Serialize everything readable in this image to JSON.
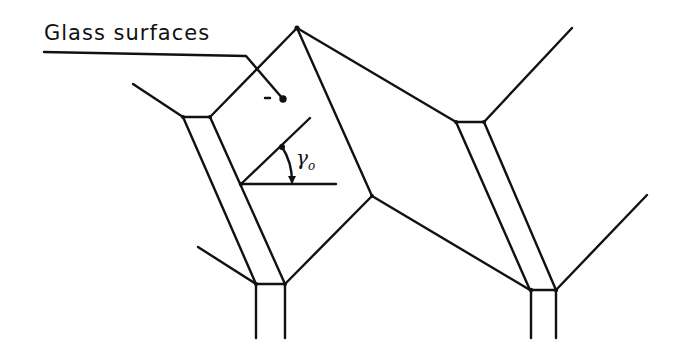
{
  "diagram": {
    "title_label": "Glass surfaces",
    "angle_label": "γ",
    "angle_subscript": "o",
    "stroke_color": "#111111",
    "background": "#ffffff",
    "structure": "Cross-section of glass cell walls with triple junctions and grain-boundary grooves",
    "nodes": {
      "top_peak": [
        297,
        28
      ],
      "center_junction": [
        372,
        196
      ],
      "left_upper_pair": [
        [
          183,
          117
        ],
        [
          210,
          117
        ]
      ],
      "left_lower_pair": [
        [
          256,
          284
        ],
        [
          285,
          284
        ]
      ],
      "right_upper_pair": [
        [
          456,
          122
        ],
        [
          484,
          122
        ]
      ],
      "right_lower_pair": [
        [
          530,
          290
        ],
        [
          556,
          290
        ]
      ]
    },
    "angle": {
      "vertex": [
        241,
        184
      ],
      "horizontal_end": [
        336,
        184
      ],
      "inclined_end": [
        310,
        118
      ]
    }
  }
}
